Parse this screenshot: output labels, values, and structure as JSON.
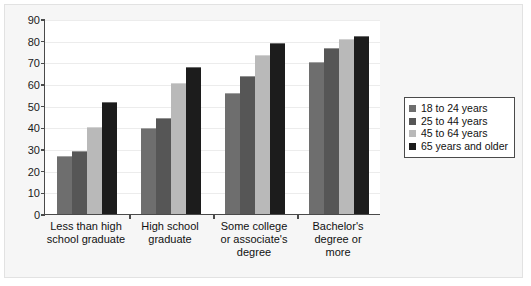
{
  "chart_data": {
    "type": "bar",
    "title": "",
    "subtitle": "",
    "xlabel": "",
    "ylabel": "",
    "ylim": [
      0,
      90
    ],
    "ytick_values": [
      0,
      10,
      20,
      30,
      40,
      50,
      60,
      70,
      80,
      90
    ],
    "ytick_labels": [
      "0",
      "10",
      "20",
      "30",
      "40",
      "50",
      "60",
      "70",
      "80",
      "90"
    ],
    "grid": true,
    "legend_position": "right",
    "categories": [
      "Less than high\nschool graduate",
      "High school\ngraduate",
      "Some college\nor associate's\ndegree",
      "Bachelor's\ndegree or\nmore"
    ],
    "series": [
      {
        "name": "18 to 24 years",
        "color": "#6e6e6e",
        "values": [
          27,
          39.5,
          56,
          70
        ]
      },
      {
        "name": "25 to 44 years",
        "color": "#565656",
        "values": [
          29,
          44.5,
          63.5,
          76.5
        ]
      },
      {
        "name": "45 to 64 years",
        "color": "#b9b9b9",
        "values": [
          40,
          60.5,
          73.5,
          81
        ]
      },
      {
        "name": "65 years and older",
        "color": "#1c1c1c",
        "values": [
          51.5,
          68,
          79,
          82
        ]
      }
    ]
  },
  "colors": {
    "panel_background": "#f6f6f6",
    "plot_background": "#ffffff",
    "axis": "#4a4a4a",
    "gridline": "#ececec",
    "text": "#111111"
  }
}
